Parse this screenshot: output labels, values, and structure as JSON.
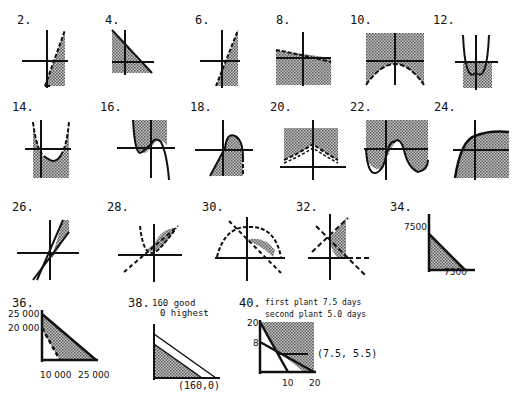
{
  "problems": [
    {
      "id": "p2",
      "label": "2."
    },
    {
      "id": "p4",
      "label": "4."
    },
    {
      "id": "p6",
      "label": "6."
    },
    {
      "id": "p8",
      "label": "8."
    },
    {
      "id": "p10",
      "label": "10."
    },
    {
      "id": "p12",
      "label": "12."
    },
    {
      "id": "p14",
      "label": "14."
    },
    {
      "id": "p16",
      "label": "16."
    },
    {
      "id": "p18",
      "label": "18."
    },
    {
      "id": "p20",
      "label": "20."
    },
    {
      "id": "p22",
      "label": "22."
    },
    {
      "id": "p24",
      "label": "24."
    },
    {
      "id": "p26",
      "label": "26."
    },
    {
      "id": "p28",
      "label": "28."
    },
    {
      "id": "p30",
      "label": "30."
    },
    {
      "id": "p32",
      "label": "32."
    },
    {
      "id": "p34",
      "label": "34."
    },
    {
      "id": "p36",
      "label": "36."
    },
    {
      "id": "p38",
      "label": "38."
    },
    {
      "id": "p40",
      "label": "40."
    }
  ],
  "p34": {
    "y_label": "7500",
    "x_label": "7500"
  },
  "p36": {
    "y_labels": [
      "25 000",
      "20 000"
    ],
    "x_labels": [
      "10 000",
      "25 000"
    ]
  },
  "p38": {
    "answer_line1": "160 good",
    "answer_line2": "0 highest",
    "point_label": "(160,0)"
  },
  "p40": {
    "answer_line1": "first plant 7.5 days",
    "answer_line2": "second plant 5.0 days",
    "y_labels": [
      "20",
      "8"
    ],
    "x_labels": [
      "10",
      "20"
    ],
    "point_label": "(7.5, 5.5)"
  },
  "colors": {
    "ink": "#111111",
    "shade": "#9a9a9a",
    "background": "#ffffff"
  }
}
